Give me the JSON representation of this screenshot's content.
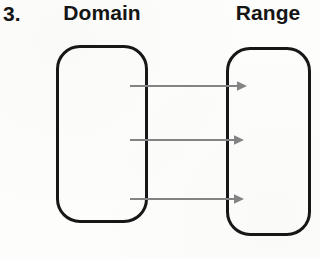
{
  "figure": {
    "item_number": "3.",
    "type": "mapping-diagram",
    "background_color": "#fdfdfc",
    "box_stroke_color": "#171717",
    "arrow_color": "#848484"
  },
  "labels": {
    "domain": "Domain",
    "range": "Range"
  },
  "sets": {
    "domain_box": {
      "name": "domain-set-oval",
      "x": 56,
      "y": 45,
      "width": 92,
      "height": 178,
      "corner_radius": 24
    },
    "range_box": {
      "name": "range-set-oval",
      "x": 226,
      "y": 47,
      "width": 85,
      "height": 189,
      "corner_radius": 24
    }
  },
  "mappings": [
    {
      "id": "arrow-1",
      "from_y": 86,
      "to_y": 86,
      "start_x": 130,
      "end_x": 247
    },
    {
      "id": "arrow-2",
      "from_y": 140,
      "to_y": 140,
      "start_x": 130,
      "end_x": 244
    },
    {
      "id": "arrow-3",
      "from_y": 199,
      "to_y": 199,
      "start_x": 130,
      "end_x": 244
    }
  ]
}
